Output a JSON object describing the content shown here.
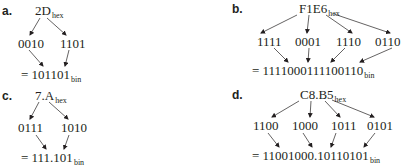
{
  "panels": {
    "a": {
      "label": "a.",
      "hex": "2D",
      "hex_sub": "hex",
      "nibbles": [
        "0010",
        "1101"
      ],
      "result": "= 101101",
      "result_sub": "bin"
    },
    "b": {
      "label": "b.",
      "hex": "F1E6",
      "hex_sub": "hex",
      "nibbles": [
        "1111",
        "0001",
        "1110",
        "0110"
      ],
      "result": "= 1111000111100110",
      "result_sub": "bin"
    },
    "c": {
      "label": "c.",
      "hex": "7.A",
      "hex_sub": "hex",
      "nibbles": [
        "0111",
        "1010"
      ],
      "result": "= 111.101",
      "result_sub": "bin"
    },
    "d": {
      "label": "d.",
      "hex": "C8.B5",
      "hex_sub": "hex",
      "nibbles": [
        "1100",
        "1000",
        "1011",
        "0101"
      ],
      "result": "= 11001000.10110101",
      "result_sub": "bin"
    }
  }
}
